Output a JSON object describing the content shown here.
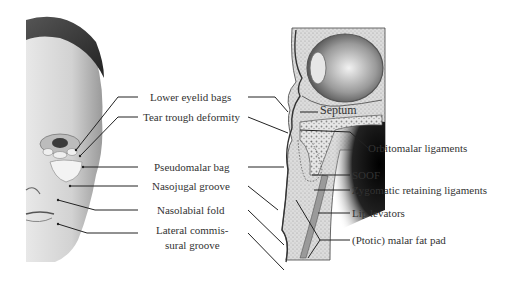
{
  "figure": {
    "left_panel": {
      "subject": "face-illustration",
      "labels": [
        {
          "id": "lower-eyelid-bags",
          "text": "Lower eyelid bags",
          "x": 150,
          "y": 92
        },
        {
          "id": "tear-trough-deformity",
          "text": "Tear trough deformity",
          "x": 143,
          "y": 112
        },
        {
          "id": "pseudomalar-bag",
          "text": "Pseudomalar bag",
          "x": 154,
          "y": 162
        },
        {
          "id": "nasojugal-groove",
          "text": "Nasojugal groove",
          "x": 152,
          "y": 181
        },
        {
          "id": "nasolabial-fold",
          "text": "Nasolabial fold",
          "x": 157,
          "y": 205
        },
        {
          "id": "lateral-commissural-groove-line1",
          "text": "Lateral commis-",
          "x": 156,
          "y": 225
        },
        {
          "id": "lateral-commissural-groove-line2",
          "text": "sural groove",
          "x": 165,
          "y": 240
        }
      ]
    },
    "right_panel": {
      "subject": "sagittal-cross-section-orbit-midface",
      "labels": [
        {
          "id": "septum",
          "text": "Septum",
          "x": 320,
          "y": 106
        },
        {
          "id": "orbitomalar-ligaments",
          "text": "Orbitomalar ligaments",
          "x": 368,
          "y": 143
        },
        {
          "id": "soof",
          "text": "SOOF",
          "x": 352,
          "y": 170
        },
        {
          "id": "zygomatic-retaining-ligaments",
          "text": "Zygomatic retaining ligaments",
          "x": 352,
          "y": 185
        },
        {
          "id": "lip-levators",
          "text": "Lip levators",
          "x": 352,
          "y": 208
        },
        {
          "id": "ptotic-malar-fat-pad",
          "text": "(Ptotic) malar fat pad",
          "x": 352,
          "y": 235
        }
      ]
    },
    "colors": {
      "line": "#222222",
      "text": "#333333",
      "skin": "#d9d9d9",
      "bone": "#cfcfcf",
      "dark": "#1a1a1a"
    }
  }
}
